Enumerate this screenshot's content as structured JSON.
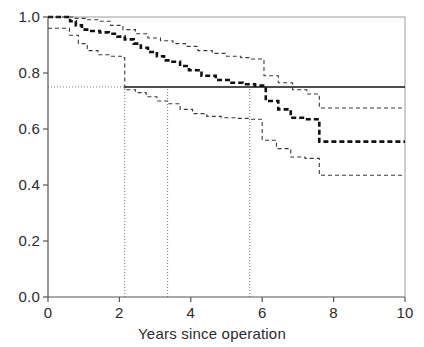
{
  "chart_data": {
    "type": "line",
    "title": "",
    "subtitle": "",
    "xlabel": "Years since operation",
    "ylabel": "",
    "xlim": [
      0,
      10
    ],
    "ylim": [
      0,
      1.0
    ],
    "grid": false,
    "legend_position": "none",
    "xticks": [
      0,
      2,
      4,
      6,
      8,
      10
    ],
    "xtick_labels": [
      "0",
      "2",
      "4",
      "6",
      "8",
      "10"
    ],
    "yticks": [
      0.0,
      0.2,
      0.4,
      0.6,
      0.8,
      1.0
    ],
    "ytick_labels": [
      "0.0",
      "0.2",
      "0.4",
      "0.6",
      "0.8",
      "1.0"
    ],
    "series": [
      {
        "name": "Survival estimate",
        "style": "thick-dashed",
        "color": "#111111",
        "step": "post",
        "x": [
          0.0,
          0.45,
          0.62,
          0.78,
          0.95,
          1.15,
          1.45,
          1.7,
          1.95,
          2.15,
          2.4,
          2.6,
          2.8,
          3.05,
          3.25,
          3.45,
          3.7,
          3.95,
          4.3,
          4.7,
          5.1,
          5.45,
          5.8,
          6.1,
          6.45,
          6.8,
          7.2,
          7.6,
          10.0
        ],
        "y": [
          1.0,
          1.0,
          0.985,
          0.97,
          0.955,
          0.95,
          0.945,
          0.94,
          0.93,
          0.92,
          0.905,
          0.89,
          0.875,
          0.86,
          0.845,
          0.84,
          0.825,
          0.81,
          0.79,
          0.775,
          0.765,
          0.76,
          0.755,
          0.7,
          0.67,
          0.64,
          0.635,
          0.555,
          0.555
        ]
      },
      {
        "name": "Upper 95% confidence limit",
        "style": "thin-dashed",
        "color": "#3a3a3a",
        "step": "post",
        "x": [
          0.0,
          0.35,
          0.7,
          1.05,
          1.4,
          1.75,
          2.1,
          2.45,
          2.8,
          3.15,
          3.5,
          3.85,
          4.2,
          4.6,
          5.0,
          5.4,
          5.7,
          6.05,
          6.45,
          6.85,
          7.25,
          7.6,
          10.0
        ],
        "y": [
          1.0,
          1.0,
          0.995,
          0.99,
          0.985,
          0.97,
          0.955,
          0.94,
          0.925,
          0.915,
          0.905,
          0.895,
          0.88,
          0.87,
          0.86,
          0.855,
          0.85,
          0.79,
          0.765,
          0.74,
          0.725,
          0.675,
          0.675
        ]
      },
      {
        "name": "Lower 95% confidence limit",
        "style": "thin-dashed",
        "color": "#3a3a3a",
        "step": "post",
        "x": [
          0.0,
          0.4,
          0.6,
          0.85,
          1.1,
          1.4,
          1.75,
          2.05,
          2.15,
          2.45,
          2.75,
          3.05,
          3.35,
          3.7,
          4.05,
          4.45,
          4.85,
          5.25,
          5.65,
          6.0,
          6.4,
          6.8,
          7.2,
          7.6,
          10.0
        ],
        "y": [
          0.96,
          0.96,
          0.935,
          0.905,
          0.88,
          0.865,
          0.86,
          0.855,
          0.74,
          0.73,
          0.715,
          0.7,
          0.69,
          0.67,
          0.655,
          0.645,
          0.64,
          0.638,
          0.635,
          0.56,
          0.53,
          0.5,
          0.495,
          0.435,
          0.435
        ]
      }
    ],
    "reference_lines": [
      {
        "name": "median-survival-level",
        "orientation": "horizontal",
        "value": 0.75,
        "style": "solid",
        "x_start": 2.15,
        "x_end": 10.0
      },
      {
        "name": "survival-guide-0.75",
        "orientation": "horizontal",
        "value": 0.75,
        "style": "dotted",
        "x_start": 0.0,
        "x_end": 2.15
      },
      {
        "name": "lower-limit-crossing",
        "orientation": "vertical",
        "value": 2.15,
        "style": "dotted",
        "y_start": 0.0,
        "y_end": 0.75
      },
      {
        "name": "estimate-crossing",
        "orientation": "vertical",
        "value": 3.35,
        "style": "dotted",
        "y_start": 0.0,
        "y_end": 0.75
      },
      {
        "name": "upper-limit-crossing",
        "orientation": "vertical",
        "value": 5.65,
        "style": "dotted",
        "y_start": 0.0,
        "y_end": 0.75
      }
    ],
    "annotations": []
  },
  "axes": {
    "x_title": "Years since operation"
  },
  "colors": {
    "axis": "#555555",
    "curve": "#111111",
    "confidence": "#3a3a3a",
    "reference": "#777777",
    "background": "#ffffff"
  }
}
